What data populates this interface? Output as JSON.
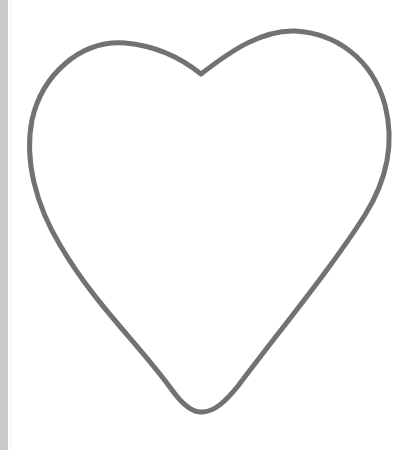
{
  "image": {
    "subject": "heart-outline",
    "description": "Hollow heart outline drawn with a gray stroke on a white background"
  },
  "colors": {
    "background": "#ffffff",
    "stroke": "#727272",
    "edge_strip": "#c9c9c9"
  },
  "shape": {
    "stroke_width": 5,
    "notch": [
      201,
      74
    ],
    "bottom_tip": [
      203,
      412
    ],
    "left_extreme": [
      29,
      140
    ],
    "right_extreme": [
      389,
      135
    ],
    "left_lobe_top": [
      125,
      43
    ],
    "right_lobe_top": [
      295,
      31
    ]
  }
}
